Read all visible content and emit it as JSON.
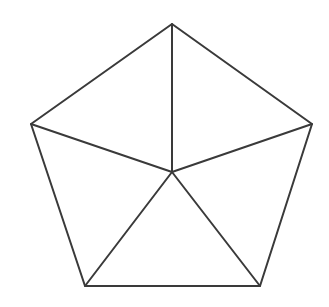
{
  "canvas": {
    "width": 329,
    "height": 307,
    "background_color": "#ffffff"
  },
  "cropped_title": {
    "text": "Pentagon",
    "note": "heading clipped at top edge; only faint stroke bottoms visible",
    "color": "#3c3c3c"
  },
  "figure": {
    "name": "pentagon-with-diagonals",
    "stroke_color": "#3a3a3a",
    "stroke_width": 2,
    "fill": "none",
    "polygon_sides": 5,
    "triangle_count": 5,
    "center": {
      "x": 172,
      "y": 172
    },
    "vertices": [
      {
        "id": "top",
        "x": 172,
        "y": 24
      },
      {
        "id": "right",
        "x": 312,
        "y": 124
      },
      {
        "id": "bottom-right",
        "x": 260,
        "y": 286
      },
      {
        "id": "bottom-left",
        "x": 85,
        "y": 286
      },
      {
        "id": "left",
        "x": 31,
        "y": 124
      }
    ],
    "outline_path": "M 172,24 L 312,124 L 260,286 L 85,286 L 31,124 Z",
    "spokes": [
      {
        "id": "spoke-top",
        "x1": 172,
        "y1": 172,
        "x2": 172,
        "y2": 24
      },
      {
        "id": "spoke-right",
        "x1": 172,
        "y1": 172,
        "x2": 312,
        "y2": 124
      },
      {
        "id": "spoke-bottom-right",
        "x1": 172,
        "y1": 172,
        "x2": 260,
        "y2": 286
      },
      {
        "id": "spoke-bottom-left",
        "x1": 172,
        "y1": 172,
        "x2": 85,
        "y2": 286
      },
      {
        "id": "spoke-left",
        "x1": 172,
        "y1": 172,
        "x2": 31,
        "y2": 124
      }
    ]
  }
}
